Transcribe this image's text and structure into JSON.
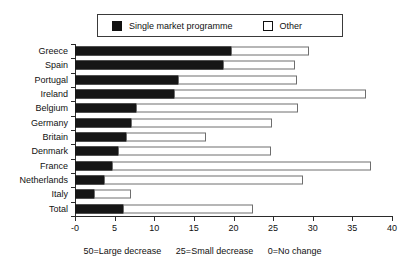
{
  "chart_data": {
    "type": "bar",
    "orientation": "horizontal",
    "stacked": true,
    "title": "",
    "xlabel": "",
    "ylabel": "",
    "xlim": [
      0,
      40
    ],
    "xticks": [
      0,
      5,
      10,
      15,
      20,
      25,
      30,
      35,
      40
    ],
    "xtick_labels": [
      "-0",
      "5",
      "10",
      "15",
      "20",
      "25",
      "30",
      "35",
      "40"
    ],
    "grid": false,
    "legend_position": "top",
    "categories": [
      "Greece",
      "Spain",
      "Portugal",
      "Ireland",
      "Belgium",
      "Germany",
      "Britain",
      "Denmark",
      "France",
      "Netherlands",
      "Italy",
      "Total"
    ],
    "series": [
      {
        "name": "Single market programme",
        "color": "#161616",
        "values": [
          19.8,
          18.8,
          13.1,
          12.6,
          7.8,
          7.2,
          6.6,
          5.5,
          4.8,
          3.8,
          2.5,
          6.2
        ]
      },
      {
        "name": "Other",
        "color": "#ffffff",
        "values": [
          9.7,
          8.9,
          14.9,
          24.1,
          20.4,
          17.6,
          9.9,
          19.2,
          32.6,
          25.0,
          4.6,
          16.2
        ]
      }
    ],
    "totals": [
      29.5,
      27.7,
      28.0,
      36.7,
      28.2,
      24.8,
      16.5,
      24.7,
      37.4,
      28.8,
      7.1,
      22.4
    ],
    "annotations": [
      "50=Large decrease",
      "25=Small decrease",
      "0=No change"
    ]
  },
  "legend": {
    "items": [
      {
        "label": "Single market programme",
        "swatch": "filled"
      },
      {
        "label": "Other",
        "swatch": "hollow"
      }
    ]
  },
  "footnote": {
    "part1": "50=Large decrease",
    "part2": "25=Small decrease",
    "part3": "0=No change"
  }
}
